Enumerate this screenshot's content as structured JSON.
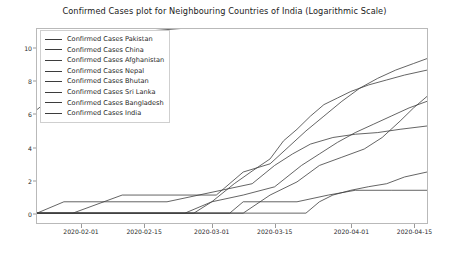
{
  "chart_data": {
    "type": "line",
    "title": "Confirmed Cases plot for Neighbouring Countries of India (Logarithmic Scale)",
    "xlabel": "",
    "ylabel": "",
    "scale": "logarithmic",
    "grid": false,
    "legend_position": "upper left",
    "ylim": [
      -0.6,
      11.2
    ],
    "yticks": [
      0,
      2,
      4,
      6,
      8,
      10
    ],
    "ytick_labels": [
      "0",
      "2",
      "4",
      "6",
      "8",
      "10"
    ],
    "xlim": [
      "2020-01-22",
      "2020-04-18"
    ],
    "xticks": [
      "2020-02-01",
      "2020-02-15",
      "2020-03-01",
      "2020-03-15",
      "2020-04-01",
      "2020-04-15"
    ],
    "xtick_labels": [
      "2020-02-01",
      "2020-02-15",
      "2020-03-01",
      "2020-03-15",
      "2020-04-01",
      "2020-04-15"
    ],
    "line_color": "#3d3d3d",
    "series": [
      {
        "name": "Confirmed Cases Pakistan",
        "legend_label": "Confirmed Cases Pakistan",
        "x": [
          "2020-01-22",
          "2020-02-26",
          "2020-03-01",
          "2020-03-06",
          "2020-03-10",
          "2020-03-14",
          "2020-03-17",
          "2020-03-20",
          "2020-03-23",
          "2020-03-26",
          "2020-03-29",
          "2020-04-01",
          "2020-04-05",
          "2020-04-09",
          "2020-04-13",
          "2020-04-18"
        ],
        "values": [
          0,
          0,
          0.69,
          1.79,
          2.56,
          3.3,
          4.4,
          5.1,
          5.9,
          6.6,
          7.0,
          7.4,
          7.8,
          8.1,
          8.4,
          8.7
        ]
      },
      {
        "name": "Confirmed Cases China",
        "legend_label": "Confirmed Cases China",
        "x": [
          "2020-01-22",
          "2020-01-28",
          "2020-02-03",
          "2020-02-10",
          "2020-02-17",
          "2020-02-24",
          "2020-03-05",
          "2020-03-20",
          "2020-04-05",
          "2020-04-18"
        ],
        "values": [
          6.3,
          7.6,
          9.2,
          10.5,
          11.1,
          11.25,
          11.3,
          11.32,
          11.35,
          11.38
        ]
      },
      {
        "name": "Confirmed Cases Afghanistan",
        "legend_label": "Confirmed Cases Afghanistan",
        "x": [
          "2020-01-22",
          "2020-02-24",
          "2020-03-01",
          "2020-03-08",
          "2020-03-15",
          "2020-03-21",
          "2020-03-25",
          "2020-03-29",
          "2020-04-02",
          "2020-04-06",
          "2020-04-10",
          "2020-04-14",
          "2020-04-18"
        ],
        "values": [
          0,
          0,
          0.69,
          1.1,
          1.6,
          2.9,
          3.6,
          4.3,
          4.9,
          5.4,
          5.9,
          6.4,
          6.8
        ]
      },
      {
        "name": "Confirmed Cases Nepal",
        "legend_label": "Confirmed Cases Nepal",
        "x": [
          "2020-01-22",
          "2020-01-25",
          "2020-02-15",
          "2020-03-22",
          "2020-03-25",
          "2020-03-28",
          "2020-04-01",
          "2020-04-05",
          "2020-04-09",
          "2020-04-13",
          "2020-04-18"
        ],
        "values": [
          0,
          0,
          0,
          0,
          0.69,
          1.1,
          1.39,
          1.61,
          1.79,
          2.2,
          2.5
        ]
      },
      {
        "name": "Confirmed Cases Bhutan",
        "legend_label": "Confirmed Cases Bhutan",
        "x": [
          "2020-01-22",
          "2020-03-05",
          "2020-03-08",
          "2020-03-20",
          "2020-03-27",
          "2020-04-02",
          "2020-04-10",
          "2020-04-18"
        ],
        "values": [
          0,
          0,
          0.69,
          0.69,
          1.1,
          1.39,
          1.39,
          1.39
        ]
      },
      {
        "name": "Confirmed Cases Sri Lanka",
        "legend_label": "Confirmed Cases Sri Lanka",
        "x": [
          "2020-01-22",
          "2020-01-28",
          "2020-02-20",
          "2020-03-10",
          "2020-03-15",
          "2020-03-19",
          "2020-03-23",
          "2020-03-28",
          "2020-04-02",
          "2020-04-07",
          "2020-04-12",
          "2020-04-18"
        ],
        "values": [
          0,
          0.69,
          0.69,
          1.79,
          2.9,
          3.6,
          4.2,
          4.6,
          4.8,
          4.9,
          5.1,
          5.3
        ]
      },
      {
        "name": "Confirmed Cases Bangladesh",
        "legend_label": "Confirmed Cases Bangladesh",
        "x": [
          "2020-01-22",
          "2020-03-08",
          "2020-03-14",
          "2020-03-20",
          "2020-03-25",
          "2020-03-30",
          "2020-04-04",
          "2020-04-08",
          "2020-04-12",
          "2020-04-15",
          "2020-04-18"
        ],
        "values": [
          0,
          0,
          1.1,
          1.9,
          2.9,
          3.4,
          3.9,
          4.6,
          5.6,
          6.4,
          7.1
        ]
      },
      {
        "name": "Confirmed Cases India",
        "legend_label": "Confirmed Cases India",
        "x": [
          "2020-01-22",
          "2020-01-30",
          "2020-02-10",
          "2020-03-02",
          "2020-03-08",
          "2020-03-14",
          "2020-03-18",
          "2020-03-22",
          "2020-03-26",
          "2020-03-30",
          "2020-04-03",
          "2020-04-07",
          "2020-04-11",
          "2020-04-15",
          "2020-04-18"
        ],
        "values": [
          0,
          0,
          1.1,
          1.1,
          2.5,
          3.0,
          4.0,
          5.0,
          5.9,
          6.8,
          7.6,
          8.2,
          8.7,
          9.1,
          9.4
        ]
      }
    ]
  }
}
